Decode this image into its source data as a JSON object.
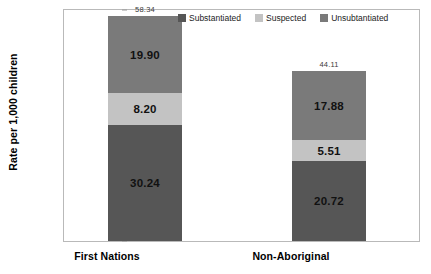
{
  "chart_data": {
    "type": "bar",
    "subtype": "stacked-bar",
    "title": "",
    "xlabel": "",
    "ylabel": "Rate per 1,000 children",
    "ylim": [
      0,
      60
    ],
    "yticks": [
      0,
      10,
      20,
      30,
      40,
      50,
      60
    ],
    "ytick_labels": [
      "0",
      "10",
      "20",
      "30",
      "40",
      "50",
      "60"
    ],
    "grid": false,
    "legend_position": "top-right",
    "categories": [
      "First Nations",
      "Non-Aboriginal"
    ],
    "series": [
      {
        "name": "Substantiated",
        "color": "#565656",
        "values": [
          30.24,
          20.72
        ],
        "labels": [
          "30.24",
          "20.72"
        ]
      },
      {
        "name": "Suspected",
        "color": "#c3c3c3",
        "values": [
          8.2,
          5.51
        ],
        "labels": [
          "8.20",
          "5.51"
        ]
      },
      {
        "name": "Unsubtantiated",
        "color": "#7a7a7a",
        "values": [
          19.9,
          17.88
        ],
        "labels": [
          "19.90",
          "17.88"
        ]
      }
    ],
    "totals": [
      58.34,
      44.11
    ],
    "total_labels": [
      "58.34",
      "44.11"
    ],
    "stack_order_bottom_to_top": [
      "Substantiated",
      "Suspected",
      "Unsubtantiated"
    ]
  },
  "legend": {
    "items": [
      {
        "label": "Substantiated",
        "color": "#565656"
      },
      {
        "label": "Suspected",
        "color": "#c3c3c3"
      },
      {
        "label": "Unsubtantiated",
        "color": "#7a7a7a"
      }
    ]
  },
  "axis": {
    "y_title": "Rate per 1,000 children"
  }
}
